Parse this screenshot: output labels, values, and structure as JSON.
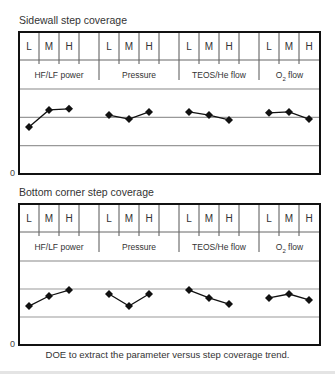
{
  "caption": "DOE to extract the parameter versus step coverage trend.",
  "chart_data": [
    {
      "type": "line",
      "title": "Sidewall step coverage",
      "xlabel": "",
      "ylabel": "",
      "y_origin_label": "0",
      "ylim": [
        0,
        3
      ],
      "grid": true,
      "gridlines_y": [
        1,
        2
      ],
      "levels": [
        "L",
        "M",
        "H"
      ],
      "groups": [
        {
          "name": "HF/LF power",
          "label_main": "HF/LF power",
          "label_sub": "",
          "label_tail": "",
          "values": [
            1.66,
            2.26,
            2.3
          ]
        },
        {
          "name": "Pressure",
          "label_main": "Pressure",
          "label_sub": "",
          "label_tail": "",
          "values": [
            2.08,
            1.94,
            2.19
          ]
        },
        {
          "name": "TEOS/He flow",
          "label_main": "TEOS/He flow",
          "label_sub": "",
          "label_tail": "",
          "values": [
            2.19,
            2.08,
            1.91
          ]
        },
        {
          "name": "O2 flow",
          "label_main": "O",
          "label_sub": "2",
          "label_tail": " flow",
          "values": [
            2.16,
            2.19,
            1.94
          ]
        }
      ]
    },
    {
      "type": "line",
      "title": "Bottom corner step coverage",
      "xlabel": "",
      "ylabel": "",
      "y_origin_label": "0",
      "ylim": [
        0,
        3
      ],
      "grid": true,
      "gridlines_y": [
        1,
        2
      ],
      "levels": [
        "L",
        "M",
        "H"
      ],
      "groups": [
        {
          "name": "HF/LF power",
          "label_main": "HF/LF power",
          "label_sub": "",
          "label_tail": "",
          "values": [
            1.39,
            1.75,
            1.96
          ]
        },
        {
          "name": "Pressure",
          "label_main": "Pressure",
          "label_sub": "",
          "label_tail": "",
          "values": [
            1.82,
            1.39,
            1.82
          ]
        },
        {
          "name": "TEOS/He flow",
          "label_main": "TEOS/He flow",
          "label_sub": "",
          "label_tail": "",
          "values": [
            1.96,
            1.68,
            1.46
          ]
        },
        {
          "name": "O2 flow",
          "label_main": "O",
          "label_sub": "2",
          "label_tail": " flow",
          "values": [
            1.68,
            1.82,
            1.61
          ]
        }
      ]
    }
  ]
}
